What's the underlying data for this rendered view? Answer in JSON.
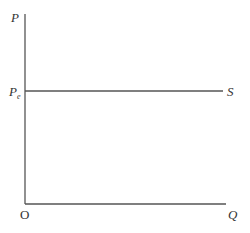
{
  "diagram": {
    "type": "perfectly elastic supply curve",
    "y_axis_label": "P",
    "x_axis_label": "Q",
    "origin_label": "O",
    "price_level_label": {
      "main": "P",
      "sub": "e"
    },
    "curve_label": "S"
  }
}
